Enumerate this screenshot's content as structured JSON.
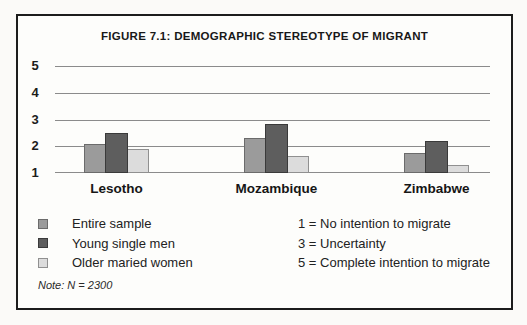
{
  "figure": {
    "title": "FIGURE 7.1: DEMOGRAPHIC STEREOTYPE OF MIGRANT",
    "note": "Note: N = 2300"
  },
  "chart_data": {
    "type": "bar",
    "title": "FIGURE 7.1: DEMOGRAPHIC STEREOTYPE OF MIGRANT",
    "categories": [
      "Lesotho",
      "Mozambique",
      "Zimbabwe"
    ],
    "series": [
      {
        "name": "Entire sample",
        "fill": "#9b9b9b",
        "border": "#6b6b6b",
        "values": [
          2.1,
          2.3,
          1.75
        ]
      },
      {
        "name": "Young single men",
        "fill": "#5e5e5e",
        "border": "#3a3a3a",
        "values": [
          2.5,
          2.85,
          2.2
        ]
      },
      {
        "name": "Older maried women",
        "fill": "#dcdcdc",
        "border": "#909090",
        "values": [
          1.9,
          1.65,
          1.3
        ]
      }
    ],
    "y_ticks": [
      5,
      4,
      3,
      2,
      1
    ],
    "ylim": [
      1,
      5
    ],
    "grid": true,
    "legend_position": "bottom-left",
    "scale_notes": [
      "1 = No intention to migrate",
      "3 = Uncertainty",
      "5 = Complete intention to migrate"
    ],
    "note": "Note: N = 2300"
  }
}
